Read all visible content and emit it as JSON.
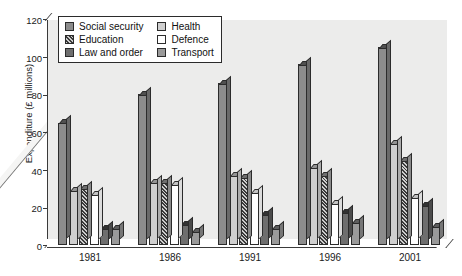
{
  "chart_data": {
    "type": "bar",
    "title": "",
    "xlabel": "",
    "ylabel": "Expenditure (£ millions)",
    "ylim": [
      0,
      120
    ],
    "yticks": [
      0,
      20,
      40,
      60,
      80,
      100,
      120
    ],
    "grid": false,
    "legend_position": "top-left",
    "categories": [
      "1981",
      "1986",
      "1991",
      "1996",
      "2001"
    ],
    "series": [
      {
        "name": "Social security",
        "values": [
          65,
          80,
          86,
          96,
          105
        ],
        "color": "#8c8c8c",
        "pattern": "solid"
      },
      {
        "name": "Health",
        "values": [
          29,
          33,
          37,
          41,
          54
        ],
        "color": "#cfcfcf",
        "pattern": "solid"
      },
      {
        "name": "Education",
        "values": [
          30,
          33,
          36,
          37,
          45
        ],
        "color": "#b0b0b0",
        "pattern": "hatch"
      },
      {
        "name": "Defence",
        "values": [
          27,
          32,
          28,
          22,
          25
        ],
        "color": "#ffffff",
        "pattern": "solid"
      },
      {
        "name": "Law and order",
        "values": [
          9,
          11,
          16,
          17,
          21
        ],
        "color": "#6e6e6e",
        "pattern": "solid"
      },
      {
        "name": "Transport",
        "values": [
          9,
          7,
          9,
          12,
          10
        ],
        "color": "#9a9a9a",
        "pattern": "solid"
      }
    ]
  },
  "legend": {
    "entries": [
      {
        "label": "Social security"
      },
      {
        "label": "Health"
      },
      {
        "label": "Education"
      },
      {
        "label": "Defence"
      },
      {
        "label": "Law and order"
      },
      {
        "label": "Transport"
      }
    ]
  },
  "axes": {
    "y_title": "Expenditure (£ millions)"
  }
}
